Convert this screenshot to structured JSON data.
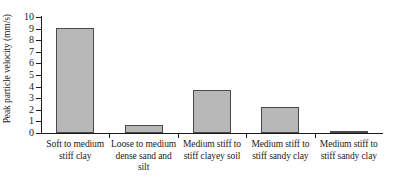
{
  "chart_data": {
    "type": "bar",
    "title": "",
    "xlabel": "",
    "ylabel": "Peak particle velocity (mm/s)",
    "ylim": [
      0,
      10
    ],
    "grid": false,
    "legend": false,
    "bar_color": "#b7b7b7",
    "bar_edge_color": "#4a4a4a",
    "axis_color": "#1a1a1a",
    "ytick_labels": [
      "10",
      "9",
      "8",
      "7",
      "6",
      "5",
      "4",
      "3",
      "2",
      "1",
      "0"
    ],
    "ytick_values": [
      10,
      9,
      8,
      7,
      6,
      5,
      4,
      3,
      2,
      1,
      0
    ],
    "categories": [
      "Soft to medium stiff clay",
      "Loose to medium dense sand and silt",
      "Medium stiff to stiff clayey soil",
      "Medium stiff to stiff sandy clay",
      "Medium stiff to stiff sandy clay"
    ],
    "values": [
      9.05,
      0.7,
      3.75,
      2.25,
      0.15
    ]
  }
}
